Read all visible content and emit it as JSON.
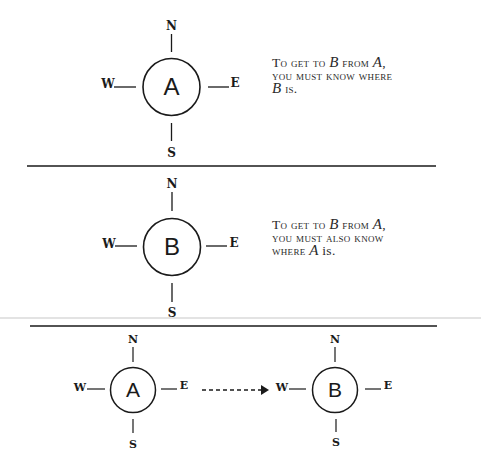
{
  "panels": [
    {
      "id": "panel-1",
      "node": {
        "label": "A",
        "cx": 171.5,
        "cy": 87,
        "r": 28.5
      },
      "compass": {
        "north": "N",
        "south": "S",
        "east": "E",
        "west": "W"
      },
      "caption": {
        "line1_pre": "To get to ",
        "line1_var1": "B",
        "line1_mid": " from ",
        "line1_var2": "A",
        "line1_post": ",",
        "line2": "you must know where",
        "line3_var": "B",
        "line3_post": " is."
      }
    },
    {
      "id": "panel-2",
      "node": {
        "label": "B",
        "cx": 172,
        "cy": 247,
        "r": 28.5
      },
      "compass": {
        "north": "N",
        "south": "S",
        "east": "E",
        "west": "W"
      },
      "caption": {
        "line1_pre": "To get to ",
        "line1_var1": "B",
        "line1_mid": " from ",
        "line1_var2": "A",
        "line1_post": ",",
        "line2": "you must also know",
        "line3_pre": "where ",
        "line3_var": "A",
        "line3_post": " is."
      }
    },
    {
      "id": "panel-3",
      "nodes": [
        {
          "label": "A",
          "cx": 133,
          "cy": 390,
          "r": 22.5
        },
        {
          "label": "B",
          "cx": 335,
          "cy": 390,
          "r": 22.5
        }
      ],
      "compass": {
        "north": "N",
        "south": "S",
        "east": "E",
        "west": "W"
      },
      "arrow": {
        "from": "A",
        "to": "B",
        "style": "dashed"
      }
    }
  ],
  "colors": {
    "ink": "#1a1a1a",
    "background": "#ffffff",
    "faint_rule": "#c8c8c8"
  }
}
